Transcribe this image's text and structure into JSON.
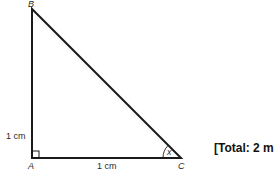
{
  "diagram": {
    "type": "right-triangle",
    "vertices": {
      "A": {
        "label": "A",
        "note": "right angle"
      },
      "B": {
        "label": "B"
      },
      "C": {
        "label": "C"
      }
    },
    "sides": {
      "AB": {
        "label": "1 cm"
      },
      "AC": {
        "label": "1 cm"
      }
    },
    "angle_C": {
      "label": "x"
    }
  },
  "marks": {
    "total_label": "[Total: 2 m"
  },
  "colors": {
    "line": "#1a1a1a",
    "text": "#2a2a2a",
    "background": "#ffffff"
  }
}
